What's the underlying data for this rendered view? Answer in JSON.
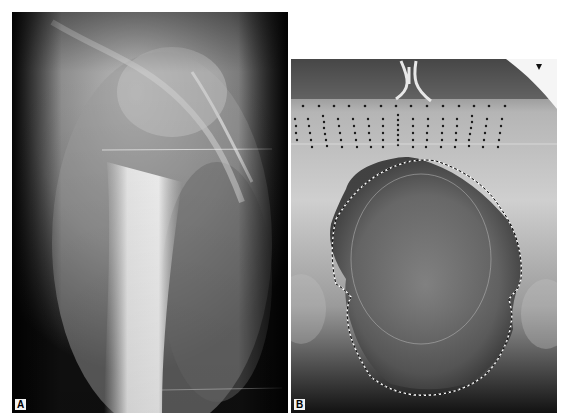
{
  "figure": {
    "panels": [
      {
        "id": "A",
        "label": "A",
        "description": "radiograph of femur region with large soft tissue mass"
      },
      {
        "id": "B",
        "label": "B",
        "description": "pelvic radiograph with dashed outline of mass and grid of marker dots"
      }
    ]
  },
  "colors": {
    "background": "#ffffff",
    "film_dark": "#0c0c0c",
    "bone_light": "#e6e6e6",
    "outline_dash": "#ffffff"
  }
}
